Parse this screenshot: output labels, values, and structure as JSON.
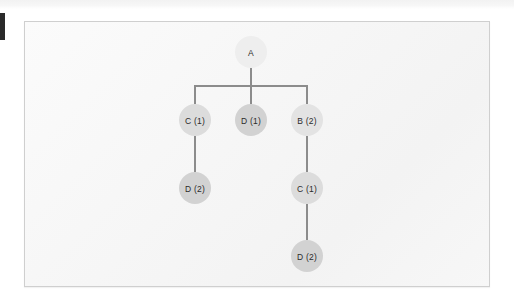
{
  "figure": {
    "type": "tree-diagram",
    "title": "",
    "background_color": "#f6f6f6",
    "panel_border_color": "#cfcfcf",
    "edge_color": "#8c8c8c",
    "label_color": "#2b2b2b"
  },
  "tree": {
    "node_radius": 16,
    "nodes": [
      {
        "id": "n0",
        "label": "A",
        "x": 251,
        "y": 52,
        "fill": "#eeeeee"
      },
      {
        "id": "n1",
        "label": "C (1)",
        "x": 195,
        "y": 120,
        "fill": "#dcdcdc"
      },
      {
        "id": "n2",
        "label": "D (1)",
        "x": 251,
        "y": 120,
        "fill": "#d2d2d2"
      },
      {
        "id": "n3",
        "label": "B (2)",
        "x": 307,
        "y": 120,
        "fill": "#e3e3e3"
      },
      {
        "id": "n4",
        "label": "D (2)",
        "x": 195,
        "y": 188,
        "fill": "#d2d2d2"
      },
      {
        "id": "n5",
        "label": "C (1)",
        "x": 307,
        "y": 188,
        "fill": "#dcdcdc"
      },
      {
        "id": "n6",
        "label": "D (2)",
        "x": 307,
        "y": 256,
        "fill": "#d2d2d2"
      }
    ],
    "edges": [
      {
        "id": "e0",
        "from": "n0",
        "to": "n1",
        "points": "251,68 251,86 195,86 195,104"
      },
      {
        "id": "e1",
        "from": "n0",
        "to": "n2",
        "points": "251,68 251,104"
      },
      {
        "id": "e2",
        "from": "n0",
        "to": "n3",
        "points": "251,68 251,86 307,86 307,104"
      },
      {
        "id": "e3",
        "from": "n1",
        "to": "n4",
        "points": "195,136 195,172"
      },
      {
        "id": "e4",
        "from": "n3",
        "to": "n5",
        "points": "307,136 307,172"
      },
      {
        "id": "e5",
        "from": "n5",
        "to": "n6",
        "points": "307,204 307,240"
      }
    ]
  },
  "marks": {
    "edge_mark_label": "page-edge-mark",
    "top_band_label": "scan-top-band"
  }
}
